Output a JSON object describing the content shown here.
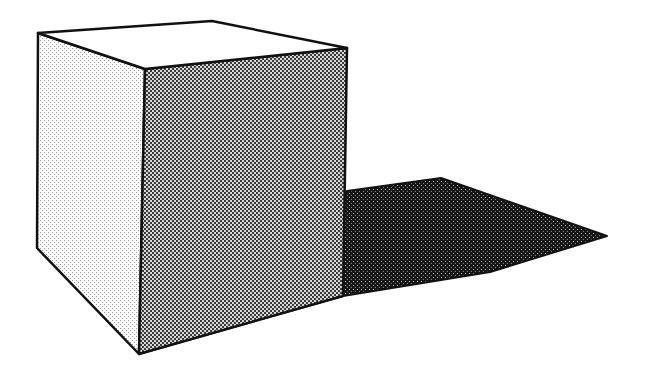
{
  "figure": {
    "width": 646,
    "height": 371,
    "background": "#ffffff",
    "stroke_color": "#111111",
    "faces": {
      "top": {
        "label": "top-face",
        "fill": "#ffffff",
        "points": [
          [
            38,
            33
          ],
          [
            212,
            21
          ],
          [
            347,
            48
          ],
          [
            145,
            69
          ]
        ]
      },
      "left": {
        "label": "left-face",
        "fill": "light-stipple",
        "points": [
          [
            38,
            33
          ],
          [
            145,
            69
          ],
          [
            139,
            354
          ],
          [
            37,
            248
          ]
        ]
      },
      "right": {
        "label": "right-face",
        "fill": "medium-halftone",
        "points": [
          [
            145,
            69
          ],
          [
            347,
            48
          ],
          [
            343,
            296
          ],
          [
            139,
            354
          ]
        ]
      }
    },
    "shadow": {
      "label": "cast-shadow",
      "fill": "dark-halftone",
      "points": [
        [
          347,
          191
        ],
        [
          441,
          178
        ],
        [
          607,
          236
        ],
        [
          490,
          272
        ],
        [
          343,
          296
        ],
        [
          139,
          354
        ]
      ]
    },
    "patterns": {
      "light": {
        "bg": "#ffffff",
        "dot": "#9a9a9a"
      },
      "medium": {
        "bg": "#d8d8d8",
        "dot": "#3a3a3a"
      },
      "dark": {
        "bg": "#9c9c9c",
        "dot": "#151515"
      }
    }
  }
}
